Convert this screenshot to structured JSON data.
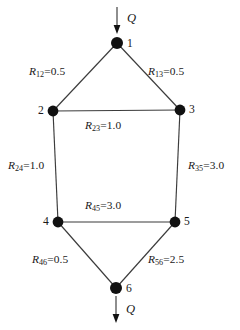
{
  "figure": {
    "type": "network-diagram",
    "title": "",
    "background_color": "#ffffff",
    "line_color": "#3b3b3b",
    "node_color": "#111111"
  },
  "flows": {
    "inlet": {
      "label": "Q",
      "node": "1",
      "direction": "down"
    },
    "outlet": {
      "label": "Q",
      "node": "6",
      "direction": "down"
    }
  },
  "nodes": [
    {
      "id": "1",
      "label": "1",
      "x": 117,
      "y": 43
    },
    {
      "id": "2",
      "label": "2",
      "x": 53,
      "y": 111
    },
    {
      "id": "3",
      "label": "3",
      "x": 180,
      "y": 110
    },
    {
      "id": "4",
      "label": "4",
      "x": 58,
      "y": 222
    },
    {
      "id": "5",
      "label": "5",
      "x": 175,
      "y": 222
    },
    {
      "id": "6",
      "label": "6",
      "x": 116,
      "y": 288
    }
  ],
  "edges": [
    {
      "id": "R12",
      "from": "1",
      "to": "2",
      "symbol": "R",
      "subscript": "12",
      "value": "0.5",
      "label": "R12=0.5"
    },
    {
      "id": "R13",
      "from": "1",
      "to": "3",
      "symbol": "R",
      "subscript": "13",
      "value": "0.5",
      "label": "R13=0.5"
    },
    {
      "id": "R23",
      "from": "2",
      "to": "3",
      "symbol": "R",
      "subscript": "23",
      "value": "1.0",
      "label": "R23=1.0"
    },
    {
      "id": "R24",
      "from": "2",
      "to": "4",
      "symbol": "R",
      "subscript": "24",
      "value": "1.0",
      "label": "R24=1.0"
    },
    {
      "id": "R35",
      "from": "3",
      "to": "5",
      "symbol": "R",
      "subscript": "35",
      "value": "3.0",
      "label": "R35=3.0"
    },
    {
      "id": "R45",
      "from": "4",
      "to": "5",
      "symbol": "R",
      "subscript": "45",
      "value": "3.0",
      "label": "R45=3.0"
    },
    {
      "id": "R46",
      "from": "4",
      "to": "6",
      "symbol": "R",
      "subscript": "46",
      "value": "0.5",
      "label": "R46=0.5"
    },
    {
      "id": "R56",
      "from": "5",
      "to": "6",
      "symbol": "R",
      "subscript": "56",
      "value": "2.5",
      "label": "R56=2.5"
    }
  ],
  "equals_sign": "="
}
